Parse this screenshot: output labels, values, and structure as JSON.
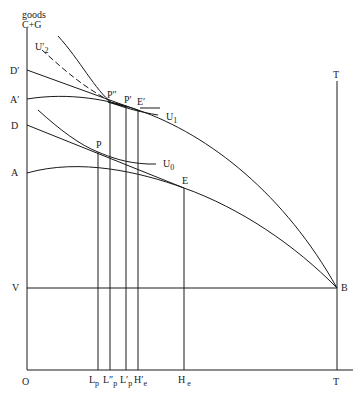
{
  "axes": {
    "y_label_line1": "goods",
    "y_label_line2": "C+G",
    "origin": "O",
    "t_bottom": "T",
    "t_top": "T"
  },
  "y_labels": {
    "d_prime": "D′",
    "a_prime": "A′",
    "d": "D",
    "a": "A",
    "v": "V"
  },
  "points": {
    "p": "P",
    "p_double_prime": "P″",
    "p_prime": "P′",
    "e_prime": "E′",
    "e": "E",
    "b": "B"
  },
  "curves": {
    "u2": {
      "main": "U",
      "sub": "2",
      "mark": "′"
    },
    "u1": {
      "main": "U",
      "sub": "1"
    },
    "u0": {
      "main": "U",
      "sub": "0"
    }
  },
  "x_labels": {
    "lp": {
      "main": "L",
      "sub": "p"
    },
    "lpp": {
      "main": "L″",
      "sub": "p"
    },
    "lp_prime": {
      "main": "L′",
      "sub": "p"
    },
    "he_prime": {
      "main": "H′",
      "sub": "e"
    },
    "he": {
      "main": "H",
      "sub": "e"
    }
  },
  "colors": {
    "ink": "#1a1a1a",
    "background": "#ffffff"
  }
}
